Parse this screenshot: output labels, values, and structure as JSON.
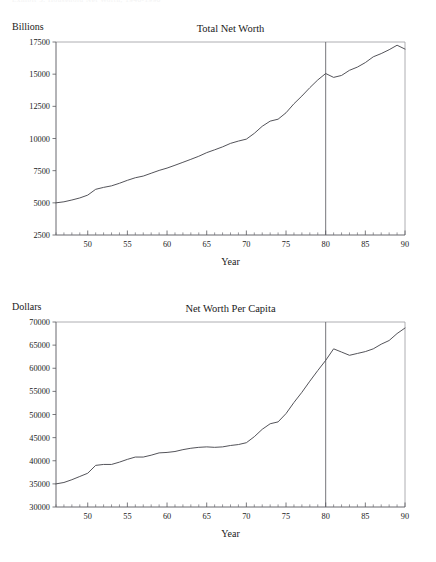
{
  "page": {
    "cropped_header_text": "Exhibit 3. Household Net Worth, 1946-1990",
    "background_color": "#ffffff",
    "line_color": "#4a4a50"
  },
  "chart_data": [
    {
      "type": "line",
      "id": "total-net-worth",
      "title": "Total Net Worth",
      "ylabel": "Billions",
      "xlabel": "Year",
      "xlim": [
        46,
        90
      ],
      "ylim": [
        2500,
        17500
      ],
      "grid": false,
      "legend": "none",
      "xticks": [
        50,
        55,
        60,
        65,
        70,
        75,
        80,
        85,
        90
      ],
      "xtick_labels": [
        "50",
        "55",
        "60",
        "65",
        "70",
        "75",
        "80",
        "85",
        "90"
      ],
      "xminor_step": 1,
      "yticks": [
        2500,
        5000,
        7500,
        10000,
        12500,
        15000,
        17500
      ],
      "ytick_labels": [
        "2500",
        "5000",
        "7500",
        "10000",
        "12500",
        "15000",
        "17500"
      ],
      "annotations": [
        {
          "type": "vline",
          "x": 80,
          "label": "year-80-divider"
        }
      ],
      "x": [
        46,
        47,
        48,
        49,
        50,
        51,
        52,
        53,
        54,
        55,
        56,
        57,
        58,
        59,
        60,
        61,
        62,
        63,
        64,
        65,
        66,
        67,
        68,
        69,
        70,
        71,
        72,
        73,
        74,
        75,
        76,
        77,
        78,
        79,
        80,
        81,
        82,
        83,
        84,
        85,
        86,
        87,
        88,
        89,
        90
      ],
      "values": [
        5000,
        5080,
        5220,
        5380,
        5600,
        6050,
        6200,
        6320,
        6520,
        6750,
        6950,
        7080,
        7300,
        7520,
        7700,
        7920,
        8150,
        8380,
        8620,
        8900,
        9120,
        9350,
        9620,
        9800,
        9950,
        10400,
        10950,
        11350,
        11500,
        12000,
        12700,
        13300,
        13950,
        14550,
        15050,
        14750,
        14900,
        15300,
        15550,
        15900,
        16350,
        16600,
        16900,
        17250,
        16950
      ]
    },
    {
      "type": "line",
      "id": "net-worth-per-capita",
      "title": "Net Worth Per Capita",
      "ylabel": "Dollars",
      "xlabel": "Year",
      "xlim": [
        46,
        90
      ],
      "ylim": [
        30000,
        70000
      ],
      "grid": false,
      "legend": "none",
      "xticks": [
        50,
        55,
        60,
        65,
        70,
        75,
        80,
        85,
        90
      ],
      "xtick_labels": [
        "50",
        "55",
        "60",
        "65",
        "70",
        "75",
        "80",
        "85",
        "90"
      ],
      "xminor_step": 1,
      "yticks": [
        30000,
        35000,
        40000,
        45000,
        50000,
        55000,
        60000,
        65000,
        70000
      ],
      "ytick_labels": [
        "30000",
        "35000",
        "40000",
        "45000",
        "50000",
        "55000",
        "60000",
        "65000",
        "70000"
      ],
      "annotations": [
        {
          "type": "vline",
          "x": 80,
          "label": "year-80-divider"
        }
      ],
      "x": [
        46,
        47,
        48,
        49,
        50,
        51,
        52,
        53,
        54,
        55,
        56,
        57,
        58,
        59,
        60,
        61,
        62,
        63,
        64,
        65,
        66,
        67,
        68,
        69,
        70,
        71,
        72,
        73,
        74,
        75,
        76,
        77,
        78,
        79,
        80,
        81,
        82,
        83,
        84,
        85,
        86,
        87,
        88,
        89,
        90
      ],
      "values": [
        35000,
        35300,
        35900,
        36600,
        37300,
        39000,
        39200,
        39200,
        39700,
        40300,
        40800,
        40800,
        41200,
        41700,
        41800,
        42000,
        42400,
        42700,
        42900,
        43000,
        42900,
        43000,
        43300,
        43500,
        43900,
        45200,
        46800,
        48000,
        48400,
        50200,
        52600,
        54800,
        57200,
        59500,
        61700,
        64200,
        63500,
        62800,
        63200,
        63600,
        64200,
        65200,
        66000,
        67500,
        68700,
        66600
      ]
    }
  ]
}
